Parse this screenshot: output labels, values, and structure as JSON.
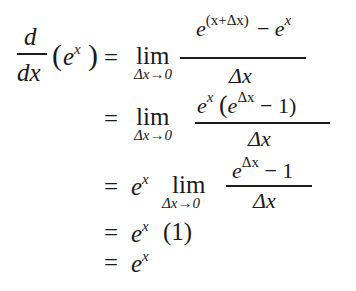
{
  "line1": {
    "lhs_num": "d",
    "lhs_den": "dx",
    "lhs_open": "(",
    "lhs_base": "e",
    "lhs_exp": "x",
    "lhs_close": ")",
    "eq": "=",
    "lim": "lim",
    "lim_sub": "Δx→0",
    "num_base": "e",
    "num_exp": "(x+Δx)",
    "num_minus": "−",
    "num_base2": "e",
    "num_exp2": "x",
    "den": "Δx"
  },
  "line2": {
    "eq": "=",
    "lim": "lim",
    "lim_sub": "Δx→0",
    "num_base": "e",
    "num_exp": "x",
    "num_open": "(",
    "num_inner_base": "e",
    "num_inner_exp": "Δx",
    "num_rest": "− 1)",
    "den": "Δx"
  },
  "line3": {
    "eq": "=",
    "coef_base": "e",
    "coef_exp": "x",
    "lim": "lim",
    "lim_sub": "Δx→0",
    "num_base": "e",
    "num_exp": "Δx",
    "num_rest": "− 1",
    "den": "Δx"
  },
  "line4": {
    "eq": "=",
    "base": "e",
    "exp": "x",
    "factor": "(1)"
  },
  "line5": {
    "eq": "=",
    "base": "e",
    "exp": "x"
  }
}
